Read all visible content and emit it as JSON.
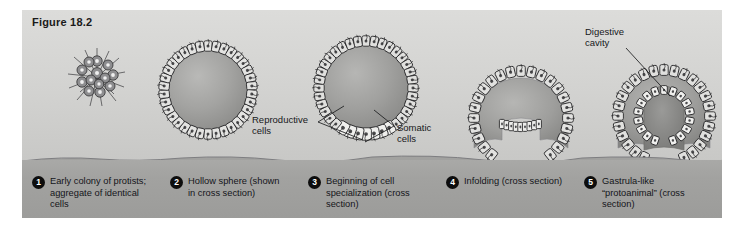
{
  "figure": {
    "title": "Figure 18.2",
    "panel_bg": "#d4d4d2",
    "sediment_color": "#a2a2a0",
    "ink_color": "#1b1c1e"
  },
  "scene_labels": [
    {
      "name": "reproductive-cells",
      "text": "Reproductive\ncells"
    },
    {
      "name": "somatic-cells",
      "text": "Somatic\ncells"
    },
    {
      "name": "digestive-cavity",
      "text": "Digestive\ncavity"
    }
  ],
  "stages": [
    {
      "number": "1",
      "text": "Early colony of protists; aggregate of  identical cells"
    },
    {
      "number": "2",
      "text": "Hollow sphere (shown in cross section)"
    },
    {
      "number": "3",
      "text": "Beginning of cell specialization (cross section)"
    },
    {
      "number": "4",
      "text": "Infolding (cross section)"
    },
    {
      "number": "5",
      "text": "Gastrula-like “protoanimal” (cross section)"
    }
  ]
}
